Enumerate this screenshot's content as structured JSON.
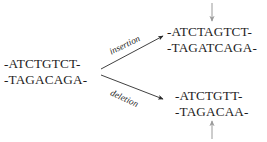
{
  "diagram": {
    "original": {
      "name": "original-sequence",
      "top_strand": "-ATCTGTCT-",
      "bottom_strand": "-TAGACAGA-"
    },
    "branches": [
      {
        "name": "insertion",
        "label": "insertion",
        "result_top_strand": "-ATCTAGTCT-",
        "result_bottom_strand": "-TAGATCAGA-",
        "marker": "down-arrow"
      },
      {
        "name": "deletion",
        "label": "deletion",
        "result_top_strand": "-ATCTGTT-",
        "result_bottom_strand": "-TAGACAA-",
        "marker": "up-arrow"
      }
    ],
    "colors": {
      "text": "#1c1c1c",
      "arrow": "#2b2b2b",
      "marker": "#9a9a9a",
      "background": "#ffffff"
    }
  }
}
